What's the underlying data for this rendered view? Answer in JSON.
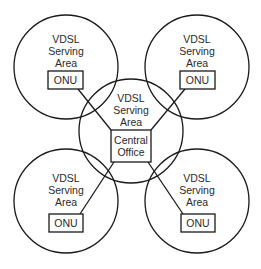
{
  "diagram": {
    "type": "network-topology",
    "colors": {
      "stroke": "#1a1a1a",
      "text": "#2a2a2a",
      "background": "#ffffff"
    },
    "areas": [
      {
        "id": "top-left",
        "label_lines": [
          "VDSL",
          "Serving",
          "Area"
        ],
        "node": "ONU"
      },
      {
        "id": "top-right",
        "label_lines": [
          "VDSL",
          "Serving",
          "Area"
        ],
        "node": "ONU"
      },
      {
        "id": "center",
        "label_lines": [
          "VDSL",
          "Serving",
          "Area"
        ],
        "node_lines": [
          "Central",
          "Office"
        ]
      },
      {
        "id": "bottom-left",
        "label_lines": [
          "VDSL",
          "Serving",
          "Area"
        ],
        "node": "ONU"
      },
      {
        "id": "bottom-right",
        "label_lines": [
          "VDSL",
          "Serving",
          "Area"
        ],
        "node": "ONU"
      }
    ],
    "links": [
      {
        "from": "Central Office",
        "to": "top-left ONU"
      },
      {
        "from": "Central Office",
        "to": "top-right ONU"
      },
      {
        "from": "Central Office",
        "to": "bottom-left ONU"
      },
      {
        "from": "Central Office",
        "to": "bottom-right ONU"
      }
    ]
  }
}
